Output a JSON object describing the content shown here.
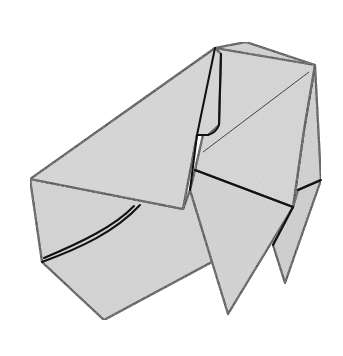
{
  "diagram": {
    "style": "line-drawing with gray speckled paper texture",
    "colors": {
      "background": "#ffffff",
      "paper": "#d9d9d9",
      "paper_shadow": "#cfcfcf",
      "outline": "#111111",
      "crease": "#333333"
    },
    "labels": {
      "caption": ""
    },
    "faces": [
      {
        "name": "back-flap",
        "points": "246,42 315,65 305,140 215,48"
      },
      {
        "name": "upper-right-panel",
        "points": "215,48 315,65 304,130 293,207 195,170 203,135"
      },
      {
        "name": "right-side-strip",
        "points": "315,65 321,180 298,190 293,207 304,130"
      },
      {
        "name": "rear-leg",
        "points": "298,190 321,180 285,283 273,245 293,207"
      },
      {
        "name": "main-body",
        "points": "30,179 42,262 104,320 212,262 228,314 195,170 190,190 183,209"
      },
      {
        "name": "front-leg",
        "points": "195,170 293,207 228,314 212,262 190,190"
      },
      {
        "name": "left-flap",
        "points": "30,179 215,48 220,58 205,130 197,135 183,209"
      }
    ],
    "creases": [
      {
        "name": "diagonal-crease",
        "d": "M 309,72 L 203,152"
      }
    ],
    "edges": [
      {
        "name": "pleat-curve-outer",
        "d": "M 42,262 C 80,248 115,232 140,205"
      },
      {
        "name": "pleat-curve-inner",
        "d": "M 44,258 C 82,242 115,226 134,206"
      },
      {
        "name": "narrow-strip-left",
        "d": "M 215,48 L 197,135 L 190,190"
      },
      {
        "name": "narrow-strip-right",
        "d": "M 221,54 L 219,125 Q 216,133 208,135 L 197,135"
      },
      {
        "name": "waist-line",
        "d": "M 195,170 L 293,207"
      },
      {
        "name": "rear-waist",
        "d": "M 298,190 L 321,180"
      }
    ]
  }
}
